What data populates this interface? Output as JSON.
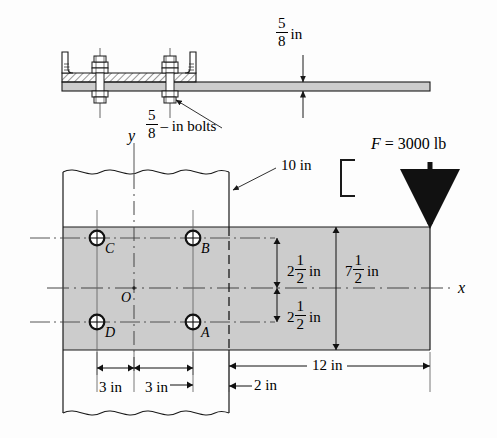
{
  "figure": {
    "type": "engineering-diagram",
    "plate_fill": "#cccccc",
    "line_color": "#1a1a1a"
  },
  "top_view": {
    "name": "side-elevation",
    "thickness_dimension": {
      "whole": "",
      "numerator": "5",
      "denominator": "8",
      "unit": "in"
    },
    "bolt_note": {
      "numerator": "5",
      "denominator": "8",
      "text": "– in bolts"
    }
  },
  "main_view": {
    "name": "front-view",
    "axis_y_label": "y",
    "axis_x_label": "x",
    "origin_label": "O",
    "force": {
      "label": "F = 3000 lb",
      "symbol": "F",
      "equals": "=",
      "magnitude": "3000",
      "units": "lb"
    },
    "channel_note": {
      "size": "10 in",
      "shape": "channel-section-symbol"
    },
    "bolts": [
      {
        "id": "A",
        "label": "A",
        "position": "lower-right"
      },
      {
        "id": "B",
        "label": "B",
        "position": "upper-right"
      },
      {
        "id": "C",
        "label": "C",
        "position": "upper-left"
      },
      {
        "id": "D",
        "label": "D",
        "position": "lower-left"
      }
    ],
    "dimensions": [
      {
        "name": "bolt-row-spacing-upper",
        "whole": "2",
        "numerator": "1",
        "denominator": "2",
        "unit": "in"
      },
      {
        "name": "bolt-row-spacing-lower",
        "whole": "2",
        "numerator": "1",
        "denominator": "2",
        "unit": "in"
      },
      {
        "name": "plate-height",
        "whole": "7",
        "numerator": "1",
        "denominator": "2",
        "unit": "in"
      },
      {
        "name": "bolt-col-spacing-left",
        "text": "3 in"
      },
      {
        "name": "bolt-col-spacing-right",
        "text": "3 in"
      },
      {
        "name": "overhang-length",
        "text": "12 in"
      },
      {
        "name": "edge-distance",
        "text": "2 in"
      }
    ]
  }
}
